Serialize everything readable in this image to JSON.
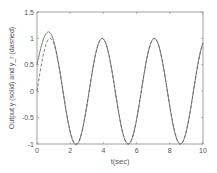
{
  "chart_data": {
    "type": "line",
    "title": "",
    "xlabel": "t(sec)",
    "ylabel": "Output y (solid) and y_r (dashed)",
    "xlim": [
      0,
      10
    ],
    "ylim": [
      -1,
      1.5
    ],
    "xticks": [
      "0",
      "2",
      "4",
      "6",
      "8",
      "10"
    ],
    "yticks": [
      "-1",
      "-0.5",
      "0",
      "0.5",
      "1",
      "1.5"
    ],
    "grid": false,
    "series": [
      {
        "name": "y (solid)",
        "style": "solid",
        "description": "starts at 0.5, overshoots to ~1.13 at t≈0.7, then tracks sin(2t)",
        "x": [
          0,
          0.7,
          2.36,
          3.93,
          5.5,
          7.07,
          8.64,
          10
        ],
        "values": [
          0.5,
          1.13,
          -1,
          1,
          -1,
          1,
          -1,
          0.91
        ]
      },
      {
        "name": "y_r (dashed)",
        "style": "dashed",
        "description": "sin(2t)",
        "x": [
          0,
          0.79,
          2.36,
          3.93,
          5.5,
          7.07,
          8.64,
          10
        ],
        "values": [
          0,
          1,
          -1,
          1,
          -1,
          1,
          -1,
          0.91
        ]
      }
    ]
  }
}
